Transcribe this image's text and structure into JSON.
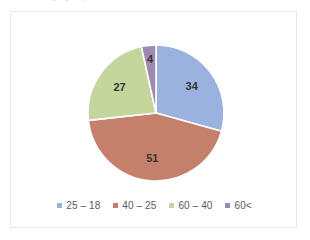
{
  "clipped_caption": "age groups",
  "chart_frame": {
    "background": "#ffffff",
    "border_color": "#e9e9e9"
  },
  "chart_data": {
    "type": "pie",
    "title": "",
    "categories": [
      "25 – 18",
      "40 – 25",
      "60 – 40",
      "60<"
    ],
    "values": [
      34,
      51,
      27,
      4
    ],
    "total": 116,
    "colors": [
      "#9cb2de",
      "#c4806b",
      "#c3d69b",
      "#9e8aae"
    ],
    "data_labels": [
      "34",
      "51",
      "27",
      "4"
    ],
    "label_color": "#3a3230",
    "slice_border_color": "#ffffff",
    "start_angle_deg": 0,
    "direction": "clockwise",
    "legend_position": "bottom",
    "legend_marker": "square",
    "grid": false,
    "xlabel": "",
    "ylabel": ""
  },
  "geometry": {
    "center_x": 145,
    "center_y": 101,
    "radius": 68,
    "label_radius_ratio": 0.66
  },
  "legend": {
    "items": [
      {
        "label": "25 – 18",
        "color": "#9cb2de"
      },
      {
        "label": "40 – 25",
        "color": "#c4806b"
      },
      {
        "label": "60 – 40",
        "color": "#c3d69b"
      },
      {
        "label": "60<",
        "color": "#9e8aae"
      }
    ]
  }
}
